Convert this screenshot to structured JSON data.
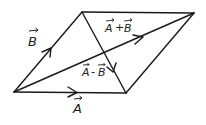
{
  "diagram": {
    "type": "vector-parallelogram",
    "vertices": {
      "origin": [
        14,
        92
      ],
      "a_tip": [
        126,
        93
      ],
      "b_tip": [
        82,
        12
      ],
      "sum_tip": [
        194,
        13
      ]
    },
    "labels": {
      "vector_a": "A",
      "vector_b": "B",
      "sum": "A+B",
      "difference": "A-B",
      "sum_a": "A",
      "sum_plus": "+",
      "sum_b": "B",
      "diff_a": "A",
      "diff_minus": "-",
      "diff_b": "B"
    },
    "colors": {
      "stroke": "#1a1a1a",
      "background": "#ffffff"
    }
  }
}
